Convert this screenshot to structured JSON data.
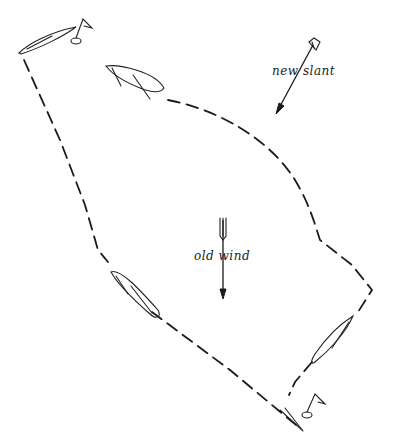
{
  "diagram": {
    "type": "sailing-tactics",
    "labels": {
      "new_wind": "new slant",
      "old_wind": "old wind"
    },
    "elements": {
      "start_buoy": "top-left flag buoy",
      "finish_buoy": "bottom-right flag buoy",
      "boats": [
        "boat-top-left",
        "boat-upper-middle",
        "boat-lower-left",
        "boat-lower-right"
      ],
      "paths": [
        "left-path (start to finish via lower-left)",
        "right-path (upper-middle boat curving down to lower-right)"
      ]
    },
    "colors": {
      "ink": "#1a1a1a",
      "background": "#ffffff"
    }
  }
}
